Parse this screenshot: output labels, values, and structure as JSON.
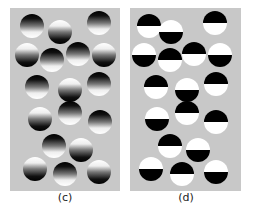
{
  "figure": {
    "panels": [
      {
        "id": "c",
        "label": "(c)",
        "style": "gradient",
        "x": 10,
        "width": 110,
        "label_x": 65,
        "circles": [
          {
            "x": 32,
            "y": 26,
            "top": "dark"
          },
          {
            "x": 60,
            "y": 32,
            "top": "light"
          },
          {
            "x": 99,
            "y": 23,
            "top": "dark"
          },
          {
            "x": 27,
            "y": 55,
            "top": "light"
          },
          {
            "x": 52,
            "y": 60,
            "top": "dark"
          },
          {
            "x": 78,
            "y": 54,
            "top": "dark"
          },
          {
            "x": 104,
            "y": 55,
            "top": "light"
          },
          {
            "x": 37,
            "y": 87,
            "top": "dark"
          },
          {
            "x": 70,
            "y": 90,
            "top": "light"
          },
          {
            "x": 99,
            "y": 84,
            "top": "dark"
          },
          {
            "x": 40,
            "y": 119,
            "top": "light"
          },
          {
            "x": 70,
            "y": 113,
            "top": "dark"
          },
          {
            "x": 100,
            "y": 122,
            "top": "dark"
          },
          {
            "x": 54,
            "y": 146,
            "top": "dark"
          },
          {
            "x": 81,
            "y": 150,
            "top": "light"
          },
          {
            "x": 35,
            "y": 169,
            "top": "light"
          },
          {
            "x": 65,
            "y": 174,
            "top": "dark"
          },
          {
            "x": 99,
            "y": 172,
            "top": "light"
          }
        ]
      },
      {
        "id": "d",
        "label": "(d)",
        "style": "binary",
        "x": 130,
        "width": 111,
        "label_x": 186,
        "circles": [
          {
            "x": 149,
            "y": 26,
            "top": "dark"
          },
          {
            "x": 171,
            "y": 32,
            "top": "light"
          },
          {
            "x": 215,
            "y": 23,
            "top": "dark"
          },
          {
            "x": 144,
            "y": 55,
            "top": "light"
          },
          {
            "x": 170,
            "y": 60,
            "top": "dark"
          },
          {
            "x": 194,
            "y": 54,
            "top": "dark"
          },
          {
            "x": 220,
            "y": 55,
            "top": "light"
          },
          {
            "x": 156,
            "y": 87,
            "top": "dark"
          },
          {
            "x": 187,
            "y": 90,
            "top": "light"
          },
          {
            "x": 216,
            "y": 84,
            "top": "dark"
          },
          {
            "x": 157,
            "y": 119,
            "top": "light"
          },
          {
            "x": 187,
            "y": 113,
            "top": "dark"
          },
          {
            "x": 216,
            "y": 122,
            "top": "dark"
          },
          {
            "x": 170,
            "y": 146,
            "top": "dark"
          },
          {
            "x": 198,
            "y": 150,
            "top": "light"
          },
          {
            "x": 151,
            "y": 169,
            "top": "light"
          },
          {
            "x": 182,
            "y": 174,
            "top": "dark"
          },
          {
            "x": 216,
            "y": 172,
            "top": "light"
          }
        ]
      }
    ]
  }
}
